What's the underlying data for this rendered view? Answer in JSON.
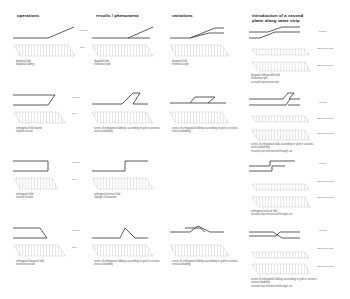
{
  "columns": [
    {
      "title": "operations"
    },
    {
      "title": "results / phenomena"
    },
    {
      "title": "variations"
    },
    {
      "title": "introduction of a second plane along same strip"
    }
  ],
  "row_labels": {
    "section": "section",
    "plan": "plan",
    "plan_upper": "plan upper strip",
    "plan_lower": "plan lower strip"
  },
  "rows": [
    {
      "operation_caption": [
        "diagonal fold",
        "diagonal folding"
      ],
      "result_caption": [
        "diagonal fold",
        "horizontal split"
      ],
      "variation_caption": [
        "diagonal fold",
        "horizontal split"
      ],
      "second_plane_caption": [
        "diagonal fold parallel fold",
        "horizontal split",
        "second strip intersected"
      ]
    },
    {
      "operation_caption": [
        "orthogonal fold sloped",
        "sloped section"
      ],
      "result_caption": [
        "series of orthogonal foldings ascending in grid in sections",
        "vertical doubling"
      ],
      "variation_caption": [
        "series of orthogonal foldings ascending in grid in sections",
        "vertical doubling"
      ],
      "second_plane_caption": [
        "series of orthogonal folds ascending in grid in sections",
        "vertical doubling",
        "second strip intersected through cut"
      ]
    },
    {
      "operation_caption": [
        "orthogonal fold",
        "vertical section"
      ],
      "result_caption": [
        "orthogonal vertical fold",
        "change of elevation"
      ],
      "variation_caption": [],
      "second_plane_caption": [
        "orthogonal vertical fold",
        "second strip intersected through cut"
      ]
    },
    {
      "operation_caption": [
        "orthogonal diagonal fold",
        "reversed section"
      ],
      "result_caption": [
        "series of orthogonal foldings ascending in grid in sections",
        "vertical doubling"
      ],
      "variation_caption": [
        "series of orthogonal foldings ascending in grid in sections",
        "vertical doubling"
      ],
      "second_plane_caption": [
        "series of orthogonal foldings ascending in grid in sections",
        "vertical doubling",
        "second strip intersected through cut"
      ]
    }
  ],
  "colors": {
    "line": "#333333",
    "hatch": "#b8b8b8",
    "plan_fill": "#f2f2f2"
  }
}
